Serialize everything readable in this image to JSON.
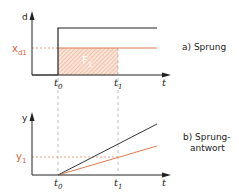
{
  "diagram": {
    "colors": {
      "line": "#222222",
      "accent": "#e07a50",
      "hatch_fill": "#fbe3d6"
    },
    "top": {
      "axis_label": "d",
      "level_label": "x",
      "level_sub": "d1",
      "area_label": "F",
      "area_sub": "1",
      "t0_label": "t",
      "t0_sub": "0",
      "t1_label": "t",
      "t1_sub": "1",
      "x_axis_label": "t",
      "caption": "a) Sprung"
    },
    "bottom": {
      "axis_label": "y",
      "level_label": "y",
      "level_sub": "1",
      "t0_label": "t",
      "t0_sub": "0",
      "t1_label": "t",
      "t1_sub": "1",
      "x_axis_label": "t",
      "caption_line1": "b) Sprung-",
      "caption_line2": "antwort"
    }
  }
}
